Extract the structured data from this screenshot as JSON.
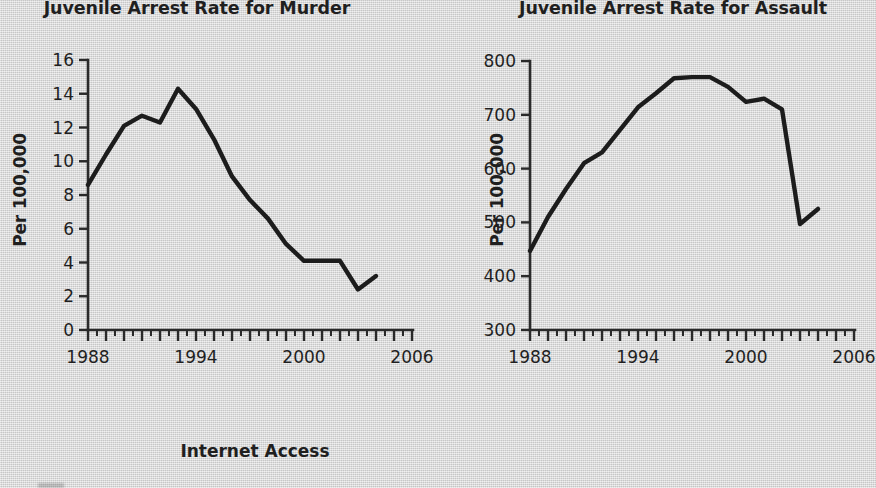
{
  "page": {
    "background_color": "#d6d6d6",
    "ink_color": "#1f1f1f",
    "footer_caption": "Internet Access"
  },
  "charts": [
    {
      "id": "murder",
      "title": "Juvenile Arrest Rate for Murder",
      "y_axis_title": "Per 100,000",
      "y_ticks": [
        "0",
        "2",
        "4",
        "6",
        "8",
        "10",
        "12",
        "14",
        "16"
      ],
      "x_ticks": [
        "1988",
        "1994",
        "2000",
        "2006"
      ]
    },
    {
      "id": "assault",
      "title": "Juvenile Arrest Rate for Assault",
      "y_axis_title": "Per 100,000",
      "y_ticks": [
        "300",
        "400",
        "500",
        "600",
        "700",
        "800"
      ],
      "x_ticks": [
        "1988",
        "1994",
        "2000",
        "2006"
      ]
    }
  ],
  "chart_data": [
    {
      "type": "line",
      "id": "murder",
      "title": "Juvenile Arrest Rate for Murder",
      "xlabel": "",
      "ylabel": "Per 100,000",
      "xlim": [
        1988,
        2006
      ],
      "ylim": [
        0,
        16
      ],
      "yticks": [
        0,
        2,
        4,
        6,
        8,
        10,
        12,
        14,
        16
      ],
      "xticks": [
        1988,
        1994,
        2000,
        2006
      ],
      "xtick_labels": [
        "1988",
        "1994",
        "2000",
        "2006"
      ],
      "x_minor_tick_interval": 0.5,
      "grid": false,
      "legend": null,
      "series": [
        {
          "name": "Juvenile arrest rate for murder (per 100,000)",
          "x": [
            1988,
            1989,
            1990,
            1991,
            1992,
            1993,
            1994,
            1995,
            1996,
            1997,
            1998,
            1999,
            2000,
            2001,
            2002,
            2003,
            2004
          ],
          "values": [
            8.6,
            10.4,
            12.1,
            12.7,
            12.3,
            14.3,
            13.1,
            11.3,
            9.1,
            7.7,
            6.6,
            5.1,
            4.1,
            4.1,
            4.1,
            2.4,
            3.2
          ]
        }
      ]
    },
    {
      "type": "line",
      "id": "assault",
      "title": "Juvenile Arrest Rate for Assault",
      "xlabel": "",
      "ylabel": "Per 100,000",
      "xlim": [
        1988,
        2006
      ],
      "ylim": [
        300,
        800
      ],
      "yticks": [
        300,
        400,
        500,
        600,
        700,
        800
      ],
      "xticks": [
        1988,
        1994,
        2000,
        2006
      ],
      "xtick_labels": [
        "1988",
        "1994",
        "2000",
        "2006"
      ],
      "x_minor_tick_interval": 0.5,
      "grid": false,
      "legend": null,
      "series": [
        {
          "name": "Juvenile arrest rate for assault (per 100,000)",
          "x": [
            1988,
            1989,
            1990,
            1991,
            1992,
            1993,
            1994,
            1995,
            1996,
            1997,
            1998,
            1999,
            2000,
            2001,
            2002,
            2003,
            2004
          ],
          "values": [
            447,
            510,
            562,
            610,
            630,
            672,
            714,
            740,
            768,
            770,
            770,
            752,
            724,
            730,
            710,
            497,
            525
          ]
        }
      ]
    }
  ]
}
